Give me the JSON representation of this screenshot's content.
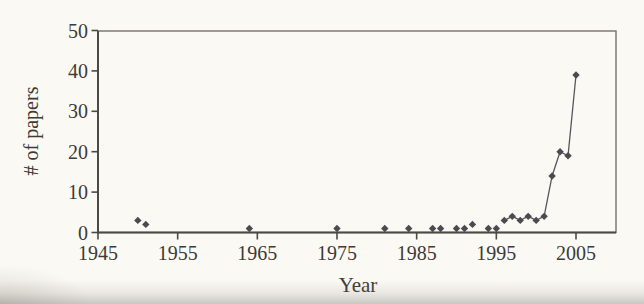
{
  "figure": {
    "background": "#fbf9f3",
    "frame_color": "#74726c",
    "axis_color": "#4c4a45",
    "tick_color": "#4c4a45",
    "text_color": "#3d3b37",
    "marker_color": "#4b4a51",
    "line_color": "#57555c"
  },
  "chart_data": {
    "type": "scatter",
    "title": "",
    "xlabel": "Year",
    "ylabel": "# of papers",
    "xlim": [
      1945,
      2010
    ],
    "ylim": [
      0,
      50
    ],
    "x_ticks": [
      1945,
      1955,
      1965,
      1975,
      1985,
      1995,
      2005
    ],
    "y_ticks": [
      0,
      10,
      20,
      30,
      40,
      50
    ],
    "grid": false,
    "legend": false,
    "marker": "diamond",
    "line_connected_from_year": 1996,
    "series": [
      {
        "name": "papers",
        "points": [
          {
            "year": 1950,
            "value": 3
          },
          {
            "year": 1951,
            "value": 2
          },
          {
            "year": 1964,
            "value": 1
          },
          {
            "year": 1975,
            "value": 1
          },
          {
            "year": 1981,
            "value": 1
          },
          {
            "year": 1984,
            "value": 1
          },
          {
            "year": 1987,
            "value": 1
          },
          {
            "year": 1988,
            "value": 1
          },
          {
            "year": 1990,
            "value": 1
          },
          {
            "year": 1991,
            "value": 1
          },
          {
            "year": 1992,
            "value": 2
          },
          {
            "year": 1994,
            "value": 1
          },
          {
            "year": 1995,
            "value": 1
          },
          {
            "year": 1996,
            "value": 3
          },
          {
            "year": 1997,
            "value": 4
          },
          {
            "year": 1998,
            "value": 3
          },
          {
            "year": 1999,
            "value": 4
          },
          {
            "year": 2000,
            "value": 3
          },
          {
            "year": 2001,
            "value": 4
          },
          {
            "year": 2002,
            "value": 14
          },
          {
            "year": 2003,
            "value": 20
          },
          {
            "year": 2004,
            "value": 19
          },
          {
            "year": 2005,
            "value": 39
          }
        ]
      }
    ]
  }
}
